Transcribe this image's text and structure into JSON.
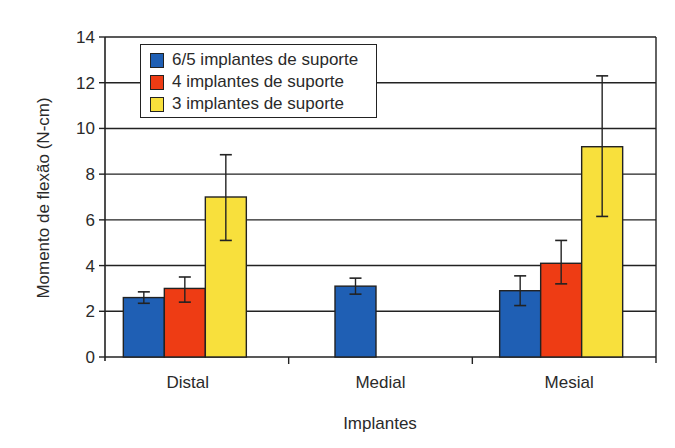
{
  "chart_data": {
    "type": "bar",
    "title": "",
    "xlabel": "Implantes",
    "ylabel": "Momento de flexão (N-cm)",
    "ylim": [
      0,
      14
    ],
    "yticks": [
      0,
      2,
      4,
      6,
      8,
      10,
      12,
      14
    ],
    "grid": true,
    "legend_position": "upper left (inside)",
    "categories": [
      "Distal",
      "Medial",
      "Mesial"
    ],
    "series": [
      {
        "name": "6/5 implantes de suporte",
        "color": "#1f5fb4",
        "values": [
          2.6,
          3.1,
          2.9
        ],
        "error_low": [
          2.35,
          2.75,
          2.25
        ],
        "error_high": [
          2.85,
          3.45,
          3.55
        ]
      },
      {
        "name": "4 implantes de suporte",
        "color": "#ee3c14",
        "values": [
          3.0,
          null,
          4.1
        ],
        "error_low": [
          2.4,
          null,
          3.2
        ],
        "error_high": [
          3.5,
          null,
          5.1
        ]
      },
      {
        "name": "3 implantes de suporte",
        "color": "#f8e03c",
        "values": [
          7.0,
          null,
          9.2
        ],
        "error_low": [
          5.1,
          null,
          6.15
        ],
        "error_high": [
          8.85,
          null,
          12.3
        ]
      }
    ]
  }
}
